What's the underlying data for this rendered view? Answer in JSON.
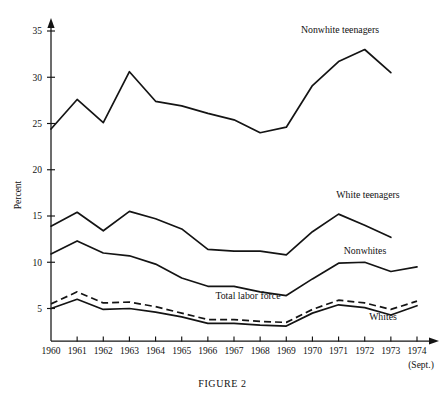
{
  "figure": {
    "caption": "FIGURE 2",
    "x_axis_note": "(Sept.)"
  },
  "chart_data": {
    "type": "line",
    "title": "",
    "xlabel": "",
    "ylabel": "Percent",
    "ylim": [
      0,
      36
    ],
    "xlim": [
      1960,
      1974
    ],
    "grid": false,
    "legend_position": "inline-annotations",
    "yticks": [
      5,
      10,
      15,
      20,
      25,
      30,
      35
    ],
    "ytick_labels": [
      "5",
      "10",
      "15",
      "20",
      "25",
      "30",
      "35"
    ],
    "categories": [
      1960,
      1961,
      1962,
      1963,
      1964,
      1965,
      1966,
      1967,
      1968,
      1969,
      1970,
      1971,
      1972,
      1973,
      1974
    ],
    "xtick_labels": [
      "1960",
      "1961",
      "1962",
      "1963",
      "1964",
      "1965",
      "1966",
      "1967",
      "1968",
      "1969",
      "1970",
      "1971",
      "1972",
      "1973",
      "1974"
    ],
    "series": [
      {
        "name": "Nonwhite teenagers",
        "style": "solid",
        "label_x": 1973,
        "values": [
          24.4,
          27.6,
          25.1,
          30.6,
          27.4,
          26.9,
          26.1,
          25.4,
          24.0,
          24.6,
          29.1,
          31.7,
          33.0,
          30.5,
          null
        ]
      },
      {
        "name": "White teenagers",
        "style": "solid",
        "label_x": 1972,
        "values": [
          13.9,
          15.4,
          13.4,
          15.5,
          14.7,
          13.6,
          11.4,
          11.2,
          11.2,
          10.8,
          13.3,
          15.2,
          14.0,
          12.7,
          null
        ]
      },
      {
        "name": "Nonwhites",
        "style": "solid",
        "label_x": 1973,
        "values": [
          10.9,
          12.3,
          11.0,
          10.7,
          9.8,
          8.3,
          7.4,
          7.4,
          6.8,
          6.4,
          8.2,
          9.9,
          10.0,
          9.0,
          9.5
        ]
      },
      {
        "name": "Total labor force",
        "style": "dashed",
        "label_x": 1967,
        "values": [
          5.5,
          6.8,
          5.6,
          5.7,
          5.2,
          4.5,
          3.8,
          3.8,
          3.6,
          3.5,
          4.9,
          5.9,
          5.6,
          4.9,
          5.8
        ]
      },
      {
        "name": "Whites",
        "style": "solid",
        "label_x": 1974,
        "values": [
          5.0,
          6.0,
          4.9,
          5.0,
          4.6,
          4.1,
          3.4,
          3.4,
          3.2,
          3.1,
          4.5,
          5.4,
          5.1,
          4.3,
          5.3
        ]
      }
    ],
    "annotations": [
      {
        "text": "Nonwhite teenagers",
        "x": 340,
        "y": 33
      },
      {
        "text": "White teenagers",
        "x": 368,
        "y": 198
      },
      {
        "text": "Nonwhites",
        "x": 365,
        "y": 254
      },
      {
        "text": "Total labor force",
        "x": 248,
        "y": 299
      },
      {
        "text": "Whites",
        "x": 383,
        "y": 320
      }
    ]
  }
}
